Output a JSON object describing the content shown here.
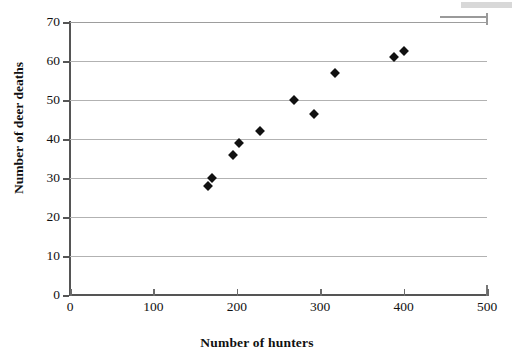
{
  "chart_data": {
    "type": "scatter",
    "title": "",
    "xlabel": "Number of hunters",
    "ylabel": "Number of deer deaths",
    "xlim": [
      0,
      500
    ],
    "ylim": [
      0,
      70
    ],
    "xticks": [
      0,
      100,
      200,
      300,
      400,
      500
    ],
    "yticks": [
      0,
      10,
      20,
      30,
      40,
      50,
      60,
      70
    ],
    "xtick_labels": [
      "0",
      "100",
      "200",
      "300",
      "400",
      "500"
    ],
    "ytick_labels": [
      "0",
      "10",
      "20",
      "30",
      "40",
      "50",
      "60",
      "70"
    ],
    "grid": "horizontal",
    "legend": "none",
    "marker": "diamond",
    "marker_color": "#111111",
    "series": [
      {
        "name": "deer deaths vs hunters",
        "points": [
          {
            "x": 165,
            "y": 28
          },
          {
            "x": 170,
            "y": 30
          },
          {
            "x": 195,
            "y": 36
          },
          {
            "x": 203,
            "y": 39
          },
          {
            "x": 228,
            "y": 42
          },
          {
            "x": 268,
            "y": 50
          },
          {
            "x": 293,
            "y": 46.5
          },
          {
            "x": 318,
            "y": 57
          },
          {
            "x": 388,
            "y": 61
          },
          {
            "x": 400,
            "y": 62.5
          }
        ]
      }
    ]
  },
  "colors": {
    "gridline": "#b2b2b2",
    "axis": "#555555",
    "marker": "#111111",
    "background": "#ffffff"
  }
}
